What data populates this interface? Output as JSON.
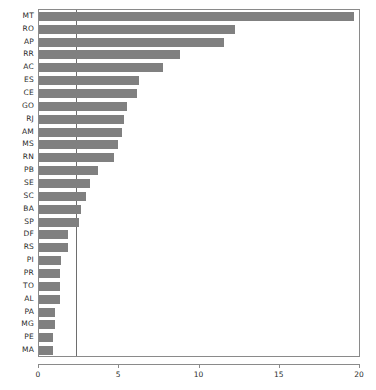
{
  "chart_data": {
    "type": "bar",
    "orientation": "horizontal",
    "title": "",
    "xlabel": "",
    "ylabel": "",
    "xlim": [
      0,
      20
    ],
    "ylim": null,
    "grid": false,
    "legend": null,
    "bar_color": "#808080",
    "frame_color": "#8a8a8a",
    "reference_line": {
      "orientation": "vertical",
      "value": 2.3,
      "color": "#6e6e6e"
    },
    "xticks": [
      0,
      5,
      10,
      15,
      20
    ],
    "xticklabels": [
      "0",
      "5",
      "10",
      "15",
      "20"
    ],
    "categories": [
      "MT",
      "RO",
      "AP",
      "RR",
      "AC",
      "ES",
      "CE",
      "GO",
      "RJ",
      "AM",
      "MS",
      "RN",
      "PB",
      "SE",
      "SC",
      "BA",
      "SP",
      "DF",
      "RS",
      "PI",
      "PR",
      "TO",
      "AL",
      "PA",
      "MG",
      "PE",
      "MA"
    ],
    "values": [
      19.6,
      12.2,
      11.5,
      8.8,
      7.7,
      6.2,
      6.1,
      5.5,
      5.3,
      5.2,
      4.9,
      4.7,
      3.7,
      3.2,
      2.9,
      2.6,
      2.5,
      1.8,
      1.8,
      1.4,
      1.3,
      1.3,
      1.3,
      1.0,
      1.0,
      0.9,
      0.9
    ]
  }
}
